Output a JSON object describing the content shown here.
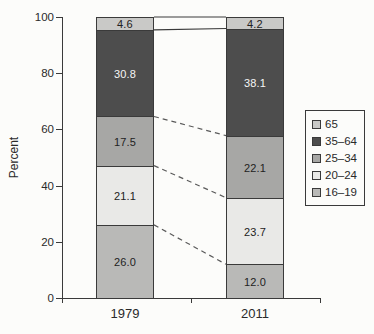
{
  "chart_data": {
    "type": "bar",
    "stacked": true,
    "title": "",
    "xlabel": "",
    "ylabel": "Percent",
    "ylim": [
      0,
      100
    ],
    "yticks": [
      0,
      20,
      40,
      60,
      80,
      100
    ],
    "grid": false,
    "legend_position": "right",
    "categories": [
      "1979",
      "2011"
    ],
    "series": [
      {
        "name": "16–19",
        "values": [
          26.0,
          12.0
        ],
        "color": "#b9b9b7",
        "text_color": "#222222"
      },
      {
        "name": "20–24",
        "values": [
          21.1,
          23.7
        ],
        "color": "#e9e9e7",
        "text_color": "#222222"
      },
      {
        "name": "25–34",
        "values": [
          17.5,
          22.1
        ],
        "color": "#a7a7a5",
        "text_color": "#222222"
      },
      {
        "name": "35–64",
        "values": [
          30.8,
          38.1
        ],
        "color": "#4d4d4d",
        "text_color": "#f6f6f6"
      },
      {
        "name": "65",
        "values": [
          4.6,
          4.2
        ],
        "color": "#c9c9c7",
        "text_color": "#222222"
      }
    ],
    "legend_order": [
      "65",
      "35–64",
      "25–34",
      "20–24",
      "16–19"
    ],
    "connectors": [
      {
        "level": 5,
        "style": "solid",
        "between": "bar tops (100%)"
      },
      {
        "level": 4,
        "style": "solid",
        "between": "65 / 35–64"
      },
      {
        "level": 3,
        "style": "dashed",
        "between": "35–64 / 25–34"
      },
      {
        "level": 2,
        "style": "dashed",
        "between": "25–34 / 20–24"
      },
      {
        "level": 1,
        "style": "dashed",
        "between": "20–24 / 16–19"
      }
    ],
    "axis_color": "#3a3a3a"
  }
}
